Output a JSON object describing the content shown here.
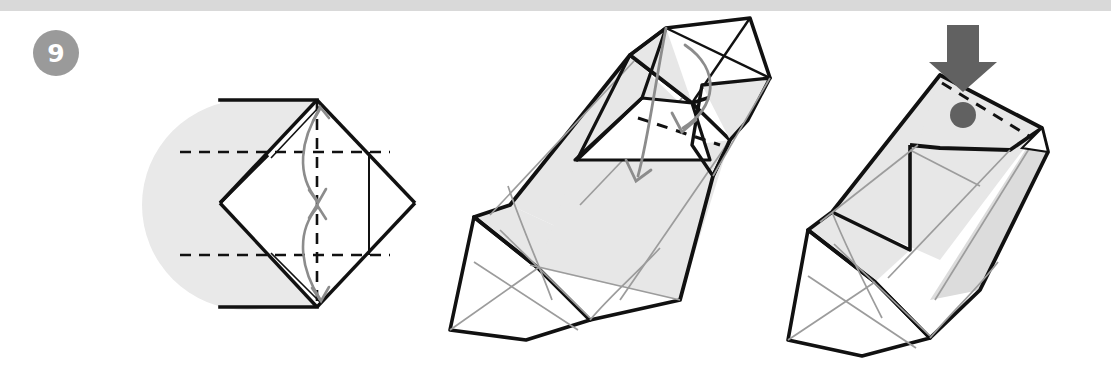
{
  "page": {
    "width": 1111,
    "height": 375,
    "background": "#ffffff",
    "kind": "origami-instruction-step"
  },
  "top_rule": {
    "color": "#d9d9d9",
    "height": 11
  },
  "step_badge": {
    "number": "9",
    "circle_color": "#9a9a9a",
    "text_color": "#ffffff",
    "diameter": 46,
    "center": [
      56,
      53
    ]
  },
  "palette": {
    "outline": "#111111",
    "thin_crease": "#9c9c9c",
    "paper_white": "#ffffff",
    "paper_gray": "#e7e7e7",
    "paper_gray_dark": "#dcdcdc",
    "shadow_circle": "#e9e9e9",
    "motion_arrow": "#8c8c8c",
    "press_arrow": "#616161",
    "marker_dot": "#616161",
    "dashed_fold": "#111111"
  },
  "figures": [
    {
      "id": "figure-1",
      "name": "flat-square-with-valley-folds",
      "caption_text": "",
      "elements": {
        "background_circle": "shadow-circle",
        "paper_shape": "rotated-square-diamond",
        "fold_lines": "dashed-grid",
        "double_edge": "folded-layer-edge",
        "arrows": [
          {
            "name": "fold-arrow-top",
            "style": "double-headed-curve",
            "direction": "down"
          },
          {
            "name": "fold-arrow-bottom",
            "style": "double-headed-curve",
            "direction": "up"
          }
        ]
      }
    },
    {
      "id": "figure-2",
      "name": "three-dimensional-form-open-flap",
      "caption_text": "",
      "elements": {
        "paper_shape": "elongated-3d-body",
        "fold_lines": "dashed-fold",
        "arrows": [
          {
            "name": "fold-arrow-inner",
            "style": "single-headed-curve",
            "direction": "down"
          },
          {
            "name": "fold-arrow-outer",
            "style": "single-headed-curve",
            "direction": "down-left"
          }
        ]
      }
    },
    {
      "id": "figure-3",
      "name": "three-dimensional-form-flap-pressed",
      "caption_text": "",
      "elements": {
        "paper_shape": "elongated-3d-body",
        "fold_lines": "dashed-fold",
        "press_arrow": {
          "name": "press-down-arrow",
          "style": "thick-block-arrow",
          "direction": "down"
        },
        "marker": {
          "name": "press-point-dot",
          "shape": "filled-circle"
        }
      }
    }
  ]
}
